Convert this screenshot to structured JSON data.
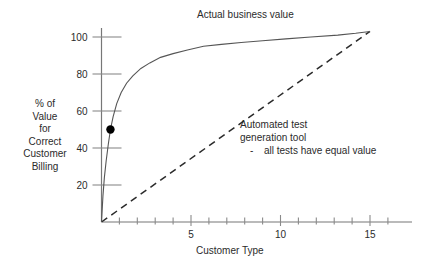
{
  "chart_data": {
    "type": "line",
    "title": "Actual business value",
    "xlabel": "Customer Type",
    "ylabel_lines": [
      "% of",
      "Value",
      "for",
      "Correct",
      "Customer",
      "Billing"
    ],
    "xlim": [
      0,
      17
    ],
    "ylim": [
      0,
      110
    ],
    "x_ticks": [
      1,
      2,
      3,
      4,
      5,
      6,
      7,
      8,
      9,
      10,
      11,
      12,
      13,
      14,
      15,
      16
    ],
    "x_tick_labels": [
      {
        "value": 5,
        "label": "5"
      },
      {
        "value": 10,
        "label": "10"
      },
      {
        "value": 15,
        "label": "15"
      }
    ],
    "y_ticks": [
      20,
      40,
      60,
      80,
      100
    ],
    "y_tick_labels": [
      "20",
      "40",
      "60",
      "80",
      "100"
    ],
    "grid": false,
    "legend": "none",
    "series": [
      {
        "name": "Actual business value",
        "style": "solid",
        "color": "#555555",
        "points": [
          [
            0.0,
            0
          ],
          [
            0.08,
            14
          ],
          [
            0.16,
            24
          ],
          [
            0.26,
            33
          ],
          [
            0.38,
            42
          ],
          [
            0.5,
            50
          ],
          [
            0.65,
            57
          ],
          [
            0.85,
            64
          ],
          [
            1.1,
            70
          ],
          [
            1.4,
            75
          ],
          [
            1.75,
            79
          ],
          [
            2.2,
            83
          ],
          [
            2.7,
            86
          ],
          [
            3.3,
            89
          ],
          [
            4.0,
            91
          ],
          [
            4.8,
            93
          ],
          [
            5.7,
            95
          ],
          [
            6.7,
            96
          ],
          [
            7.8,
            97
          ],
          [
            9.0,
            98
          ],
          [
            10.3,
            99
          ],
          [
            11.7,
            100
          ],
          [
            13.2,
            101
          ],
          [
            14.2,
            102
          ],
          [
            15.0,
            103
          ]
        ]
      },
      {
        "name": "Automated test generation tool",
        "style": "dashed",
        "color": "#2b2b2b",
        "points": [
          [
            0.0,
            0
          ],
          [
            15.0,
            103
          ]
        ]
      }
    ],
    "markers": [
      {
        "name": "correct-billing-point",
        "x": 0.5,
        "y": 50,
        "color": "#000000",
        "radius": 4.2
      }
    ],
    "annotations": [
      {
        "name": "automated-test-annotation",
        "lines": [
          "Automated test",
          "generation tool"
        ],
        "bullet_dash": "-",
        "bullet_text": "all tests have equal value"
      }
    ]
  },
  "chart": {
    "title": "Actual business value",
    "xlabel": "Customer Type",
    "ylabel_lines": [
      "% of",
      "Value",
      "for",
      "Correct",
      "Customer",
      "Billing"
    ],
    "annotation": {
      "line1": "Automated test",
      "line2": "generation tool",
      "dash": "-",
      "line3": "all tests have equal value"
    },
    "y_tick_labels": [
      "100",
      "80",
      "60",
      "40",
      "20"
    ],
    "x_tick_labels": [
      "5",
      "10",
      "15"
    ]
  }
}
